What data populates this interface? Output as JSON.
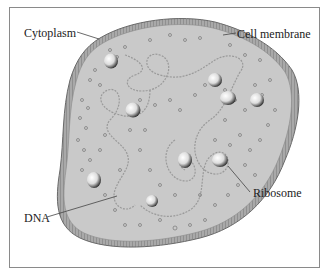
{
  "labels": {
    "cytoplasm": "Cytoplasm",
    "cell_membrane": "Cell membrane",
    "ribosome": "Ribosome",
    "dna": "DNA"
  },
  "colors": {
    "cytoplasm_fill": "#c9c9c9",
    "membrane": "#8e8e8e",
    "frame": "#8a8a8a",
    "text": "#222222"
  }
}
